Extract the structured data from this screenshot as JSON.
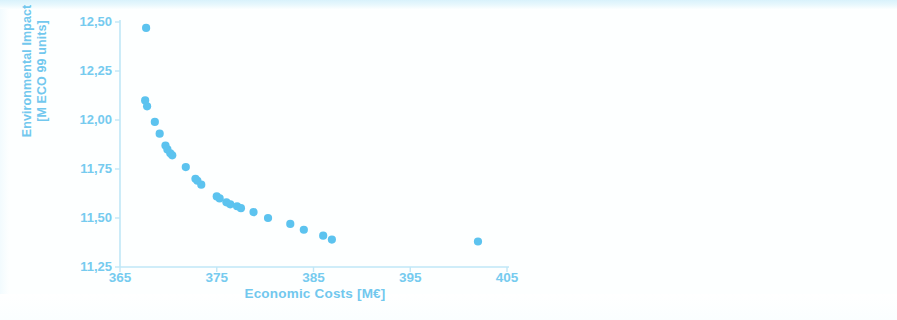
{
  "figure": {
    "background_color": "#ffffff",
    "accent_color": "#72c8ee",
    "marker_color": "#5cc3ef",
    "axis_color": "#bfe7f7"
  },
  "axes": {
    "x": {
      "title": "Economic Costs [M€]",
      "tick_labels": [
        "365",
        "375",
        "385",
        "395",
        "405"
      ],
      "tick_values": [
        365,
        375,
        385,
        395,
        405
      ],
      "min": 365,
      "max": 405
    },
    "y": {
      "title_line1": "Environmental Impact",
      "title_line2": "[M ECO 99 units]",
      "title": "Environmental Impact\n[M ECO 99 units]",
      "tick_labels": [
        "12,50",
        "12,25",
        "12,00",
        "11,75",
        "11,50",
        "11,25"
      ],
      "tick_values": [
        12.5,
        12.25,
        12.0,
        11.75,
        11.5,
        11.25
      ],
      "min": 11.25,
      "max": 12.5
    }
  },
  "chart_data": {
    "type": "scatter",
    "title": "",
    "xlabel": "Economic Costs [M€]",
    "ylabel": "Environmental Impact [M ECO 99 units]",
    "xlim": [
      365,
      405
    ],
    "ylim": [
      11.25,
      12.5
    ],
    "grid": false,
    "legend": null,
    "marker_color": "#5cc3ef",
    "marker_size": 7,
    "series": [
      {
        "name": "Pareto front",
        "points": [
          [
            367.7,
            12.47
          ],
          [
            367.6,
            12.1
          ],
          [
            367.8,
            12.07
          ],
          [
            368.6,
            11.99
          ],
          [
            369.1,
            11.93
          ],
          [
            369.7,
            11.87
          ],
          [
            369.9,
            11.85
          ],
          [
            370.2,
            11.83
          ],
          [
            370.4,
            11.82
          ],
          [
            371.8,
            11.76
          ],
          [
            372.8,
            11.7
          ],
          [
            373.0,
            11.69
          ],
          [
            373.4,
            11.67
          ],
          [
            375.0,
            11.61
          ],
          [
            375.3,
            11.6
          ],
          [
            376.0,
            11.58
          ],
          [
            376.4,
            11.57
          ],
          [
            377.1,
            11.56
          ],
          [
            377.5,
            11.55
          ],
          [
            378.8,
            11.53
          ],
          [
            380.3,
            11.5
          ],
          [
            382.6,
            11.47
          ],
          [
            384.0,
            11.44
          ],
          [
            386.0,
            11.41
          ],
          [
            386.9,
            11.39
          ],
          [
            402.0,
            11.38
          ]
        ]
      }
    ]
  }
}
